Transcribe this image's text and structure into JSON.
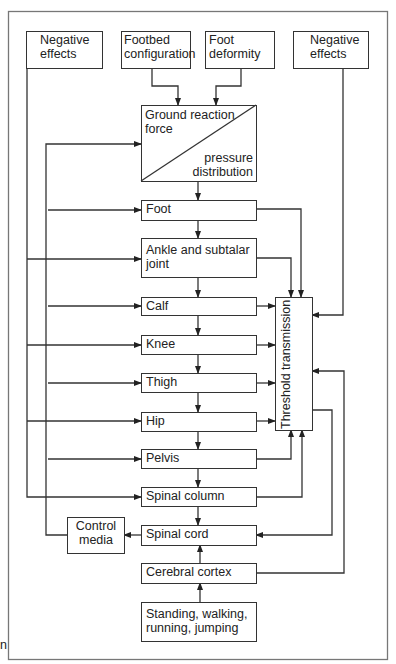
{
  "diagram": {
    "top_inputs": {
      "negative_effects_left": "Negative effects",
      "footbed_configuration": "Footbed configuration",
      "foot_deformity": "Foot deformity",
      "negative_effects_right": "Negative effects"
    },
    "ground_reaction": {
      "upper": "Ground reaction force",
      "lower": "pressure distribution"
    },
    "chain": [
      {
        "id": "foot",
        "label": "Foot"
      },
      {
        "id": "ankle",
        "label": "Ankle and subtalar joint"
      },
      {
        "id": "calf",
        "label": "Calf"
      },
      {
        "id": "knee",
        "label": "Knee"
      },
      {
        "id": "thigh",
        "label": "Thigh"
      },
      {
        "id": "hip",
        "label": "Hip"
      },
      {
        "id": "pelvis",
        "label": "Pelvis"
      },
      {
        "id": "spinal_column",
        "label": "Spinal column"
      },
      {
        "id": "spinal_cord",
        "label": "Spinal cord"
      },
      {
        "id": "cerebral_cortex",
        "label": "Cerebral cortex"
      },
      {
        "id": "activities",
        "label": "Standing, walking, running, jumping"
      }
    ],
    "threshold": "Threshold transmission",
    "control_media": "Control media",
    "margin_fragment": "n"
  }
}
